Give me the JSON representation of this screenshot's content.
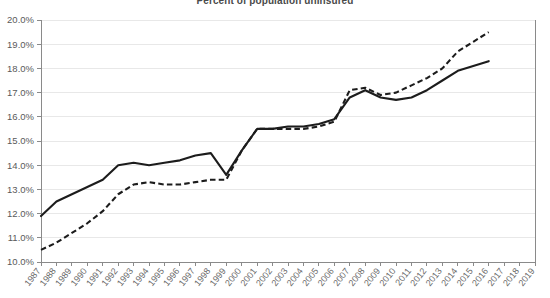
{
  "chart_data": {
    "type": "line",
    "title": "Percent of population uninsured",
    "xlabel": "",
    "ylabel": "",
    "ylim": [
      10.0,
      20.0
    ],
    "ytick_step": 1.0,
    "ytick_labels": [
      "10.0%",
      "11.0%",
      "12.0%",
      "13.0%",
      "14.0%",
      "15.0%",
      "16.0%",
      "17.0%",
      "18.0%",
      "19.0%",
      "20.0%"
    ],
    "grid": true,
    "legend": "none",
    "x": [
      1987,
      1988,
      1989,
      1990,
      1991,
      1992,
      1993,
      1994,
      1995,
      1996,
      1997,
      1998,
      1999,
      2000,
      2001,
      2002,
      2003,
      2004,
      2005,
      2006,
      2007,
      2008,
      2009,
      2010,
      2011,
      2012,
      2013,
      2014,
      2015,
      2016,
      2017,
      2018,
      2019
    ],
    "categories": [
      "1987",
      "1988",
      "1989",
      "1990",
      "1991",
      "1992",
      "1993",
      "1994",
      "1995",
      "1996",
      "1997",
      "1998",
      "1999",
      "2000",
      "2001",
      "2002",
      "2003",
      "2004",
      "2005",
      "2006",
      "2007",
      "2008",
      "2009",
      "2010",
      "2011",
      "2012",
      "2013",
      "2014",
      "2015",
      "2016",
      "2017",
      "2018",
      "2019"
    ],
    "series": [
      {
        "name": "solid-series",
        "style": "solid",
        "color": "#1c1c1c",
        "values": [
          11.9,
          12.5,
          12.8,
          13.1,
          13.4,
          14.0,
          14.1,
          14.0,
          14.1,
          14.2,
          14.4,
          14.5,
          13.6,
          14.6,
          15.5,
          15.5,
          15.6,
          15.6,
          15.7,
          15.9,
          16.8,
          17.1,
          16.8,
          16.7,
          16.8,
          17.1,
          17.5,
          17.9,
          18.1,
          18.3,
          null,
          null,
          null
        ]
      },
      {
        "name": "dashed-series",
        "style": "dashed",
        "color": "#1c1c1c",
        "values": [
          10.5,
          10.8,
          11.2,
          11.6,
          12.1,
          12.8,
          13.2,
          13.3,
          13.2,
          13.2,
          13.3,
          13.4,
          13.4,
          14.6,
          15.5,
          15.5,
          15.5,
          15.5,
          15.6,
          15.8,
          17.1,
          17.2,
          16.9,
          17.0,
          17.3,
          17.6,
          18.0,
          18.7,
          19.1,
          19.5,
          null,
          null,
          null
        ]
      }
    ]
  },
  "geometry": {
    "plot_left": 41,
    "plot_right": 535,
    "plot_top": 20,
    "plot_bottom": 262
  }
}
